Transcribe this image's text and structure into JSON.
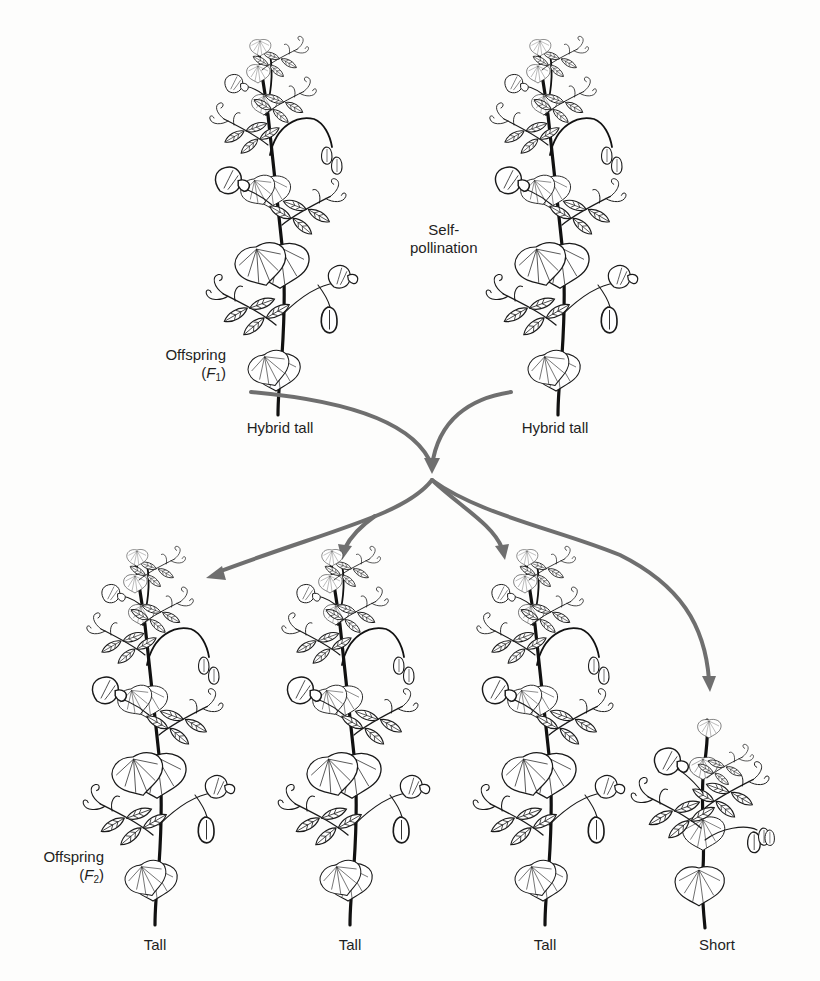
{
  "diagram": {
    "type": "genetic-cross",
    "arrow_color": "#6f6f6f",
    "ink_color": "#1a1a1a",
    "background": "#fdfdfc"
  },
  "labels": {
    "self_pollination_line1": "Self-",
    "self_pollination_line2": "pollination",
    "f1_generation_word": "Offspring",
    "f1_generation_symbol_letter": "F",
    "f1_generation_symbol_sub": "1",
    "f2_generation_word": "Offspring",
    "f2_generation_symbol_letter": "F",
    "f2_generation_symbol_sub": "2"
  },
  "f1_plants": [
    {
      "label": "Hybrid tall",
      "x": 280,
      "size": "tall"
    },
    {
      "label": "Hybrid tall",
      "x": 555,
      "size": "tall"
    }
  ],
  "f2_plants": [
    {
      "label": "Tall",
      "x": 155,
      "size": "tall"
    },
    {
      "label": "Tall",
      "x": 350,
      "size": "tall"
    },
    {
      "label": "Tall",
      "x": 545,
      "size": "tall"
    },
    {
      "label": "Short",
      "x": 715,
      "size": "short"
    }
  ],
  "arrows": [
    {
      "id": "f1-left-merge",
      "path": "M251 392 C 340 400, 415 420, 432 470"
    },
    {
      "id": "f1-right-merge",
      "path": "M511 392 C 470 398, 438 420, 432 470"
    },
    {
      "id": "to-f2-1",
      "path": "M432 478 C 400 520, 330 525, 208 575"
    },
    {
      "id": "to-f2-2",
      "path": "M380 514 C 360 525, 350 535, 342 553"
    },
    {
      "id": "to-f2-3",
      "path": "M432 478 C 460 510, 495 525, 505 553"
    },
    {
      "id": "to-f2-4",
      "path": "M432 478 C 480 515, 560 530, 620 555 C 680 585, 705 625, 710 690"
    }
  ]
}
